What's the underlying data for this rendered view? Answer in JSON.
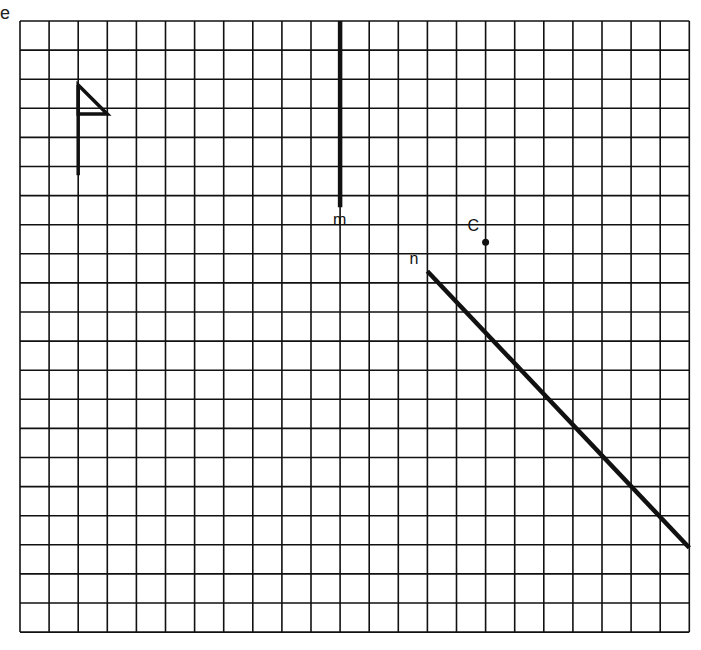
{
  "edge_label": "e",
  "grid": {
    "cols": 23,
    "rows": 21,
    "origin_x": 20,
    "origin_y": 21,
    "cell": 29.1,
    "line_color": "#111111"
  },
  "figures": {
    "flag": {
      "label": "flag-figure",
      "pole": [
        [
          2,
          2.2
        ],
        [
          2,
          5.3
        ]
      ],
      "triangle": [
        [
          2,
          2.2
        ],
        [
          3,
          3.2
        ],
        [
          2,
          3.2
        ]
      ]
    },
    "line_m": {
      "label": "m",
      "from": [
        11,
        0
      ],
      "to": [
        11,
        6.4
      ]
    },
    "line_n": {
      "label": "n",
      "from": [
        14,
        8.6
      ],
      "to": [
        23,
        18.1
      ]
    },
    "point_c": {
      "label": "C",
      "at": [
        16,
        7.6
      ]
    }
  },
  "labels": {
    "m": "m",
    "n": "n",
    "c": "C"
  }
}
